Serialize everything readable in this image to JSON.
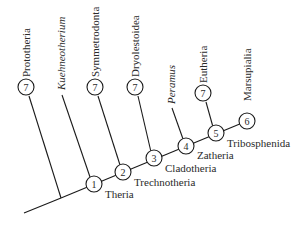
{
  "diagram": {
    "type": "cladogram",
    "colors": {
      "line": "#1a1a1a",
      "text": "#2a2a2a",
      "background": "#ffffff"
    },
    "taxa": [
      {
        "id": "prototheria",
        "label": "Prototheria",
        "italic": false,
        "node_badge": "7"
      },
      {
        "id": "kuehneotherium",
        "label": "Kuehneotherium",
        "italic": true,
        "node_badge": null
      },
      {
        "id": "symmetrodonta",
        "label": "Symmetrodonta",
        "italic": false,
        "node_badge": "7"
      },
      {
        "id": "dryolestoidea",
        "label": "Dryolestoidea",
        "italic": false,
        "node_badge": "7"
      },
      {
        "id": "peramus",
        "label": "Peramus",
        "italic": true,
        "node_badge": null
      },
      {
        "id": "eutheria",
        "label": "Eutheria",
        "italic": false,
        "node_badge": "7"
      },
      {
        "id": "marsupialia",
        "label": "Marsupialia",
        "italic": false,
        "node_badge": null
      }
    ],
    "nodes": [
      {
        "number": "1",
        "clade": "Theria"
      },
      {
        "number": "2",
        "clade": "Trechnotheria"
      },
      {
        "number": "3",
        "clade": "Cladotheria"
      },
      {
        "number": "4",
        "clade": "Zatheria"
      },
      {
        "number": "5",
        "clade": "Tribosphenida"
      },
      {
        "number": "6",
        "clade": ""
      }
    ]
  }
}
